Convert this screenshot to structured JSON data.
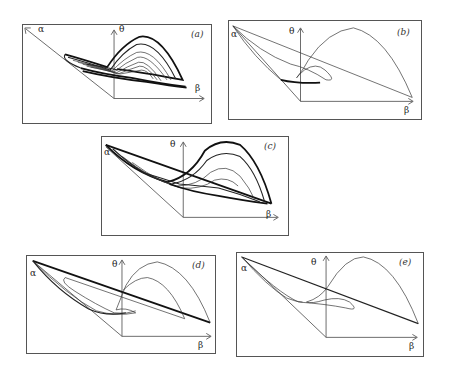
{
  "figure": {
    "axis_labels": {
      "alpha": "α",
      "beta": "β",
      "theta": "θ"
    },
    "panels": [
      {
        "id": "a",
        "label": "(a)",
        "style": "dense chaotic attractor, many nested loops"
      },
      {
        "id": "b",
        "label": "(b)",
        "style": "single thin periodic orbit with small loop"
      },
      {
        "id": "c",
        "label": "(c)",
        "style": "dense attractor with multiple bands"
      },
      {
        "id": "d",
        "label": "(d)",
        "style": "period-two orbit with two arches"
      },
      {
        "id": "e",
        "label": "(e)",
        "style": "single periodic orbit with loop"
      }
    ]
  }
}
